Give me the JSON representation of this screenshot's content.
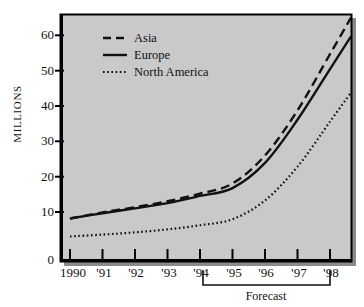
{
  "chart_data": {
    "type": "line",
    "title": "",
    "subtitle": "",
    "xlabel": "",
    "ylabel": "MILLIONS",
    "categories": [
      "1990",
      "'91",
      "'92",
      "'93",
      "'94",
      "'95",
      "'96",
      "'97",
      "'98"
    ],
    "x": [
      1990,
      1991,
      1992,
      1993,
      1994,
      1995,
      1996,
      1997,
      1998
    ],
    "xlim": [
      1990,
      1998.6
    ],
    "ylim": [
      0,
      64
    ],
    "yticks": [
      0,
      10,
      20,
      30,
      40,
      50,
      60
    ],
    "ytick_labels": [
      "0",
      "10",
      "20",
      "30",
      "40",
      "50",
      "60"
    ],
    "grid": false,
    "legend_position": "upper-left-inside",
    "series": [
      {
        "name": "Asia",
        "style": "dashed",
        "color": "#111111",
        "values": [
          11.2,
          12.8,
          14.2,
          15.8,
          17.8,
          20.5,
          28.0,
          40.0,
          55.0
        ]
      },
      {
        "name": "Europe",
        "style": "solid",
        "color": "#111111",
        "values": [
          11.2,
          12.6,
          13.9,
          15.3,
          17.2,
          19.3,
          26.0,
          37.5,
          51.0
        ]
      },
      {
        "name": "North America",
        "style": "dotted",
        "color": "#111111",
        "values": [
          6.4,
          6.9,
          7.5,
          8.3,
          9.4,
          11.0,
          16.0,
          25.0,
          37.0
        ]
      }
    ],
    "annotations": [
      {
        "name": "forecast-bracket",
        "label": "Forecast",
        "x_start": "'94",
        "x_end": "'98"
      }
    ]
  },
  "legend": {
    "entries": [
      {
        "label": "Asia",
        "style": "dashed"
      },
      {
        "label": "Europe",
        "style": "solid"
      },
      {
        "label": "North America",
        "style": "dotted"
      }
    ]
  },
  "axis": {
    "y_title": "MILLIONS",
    "y_tick_labels": [
      "60",
      "50",
      "40",
      "30",
      "20",
      "10",
      "0"
    ],
    "x_tick_labels": [
      "1990",
      "'91",
      "'92",
      "'93",
      "'94",
      "'95",
      "'96",
      "'97",
      "'98"
    ]
  },
  "forecast": {
    "label": "Forecast"
  },
  "colors": {
    "plot_background": "#c9c9c9",
    "page_background": "#ffffff",
    "line": "#111111",
    "frame": "#000000",
    "shadow": "#8a8a8a"
  }
}
